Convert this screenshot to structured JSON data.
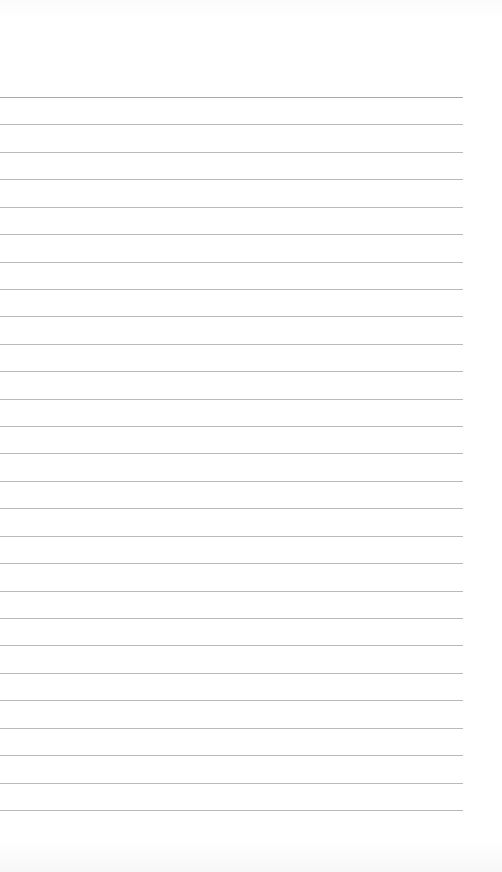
{
  "page": {
    "type": "lined-paper",
    "background_color": "#fefefe",
    "rule_color": "#b9b9b9",
    "rule_count": 27,
    "first_rule_y": 97,
    "rule_spacing": 27.42,
    "rule_width": 463
  }
}
